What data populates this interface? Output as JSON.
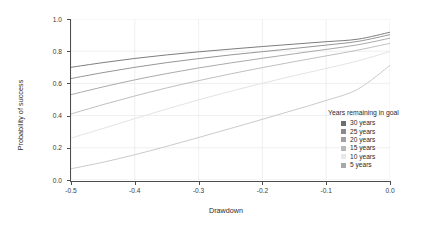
{
  "chart_data": {
    "type": "line",
    "title": "",
    "xlabel": "Drawdown",
    "ylabel": "Probability of success",
    "xlim": [
      -0.5,
      0.0
    ],
    "ylim": [
      0.0,
      1.0
    ],
    "xticks": [
      -0.5,
      -0.4,
      -0.3,
      -0.2,
      -0.1,
      0.0
    ],
    "xtick_labels": [
      "-0.5",
      "-0.4",
      "-0.3",
      "-0.2",
      "-0.1",
      "0.0"
    ],
    "yticks": [
      0.0,
      0.2,
      0.4,
      0.6,
      0.8,
      1.0
    ],
    "ytick_labels": [
      "0.0",
      "0.2",
      "0.4",
      "0.6",
      "0.8",
      "1.0"
    ],
    "grid": true,
    "grid_color": "#ebebeb",
    "panel_background": "#ffffff",
    "legend_position": "right-inside",
    "legend_title": "Years remaining in goal",
    "x": [
      -0.5,
      -0.45,
      -0.4,
      -0.35,
      -0.3,
      -0.25,
      -0.2,
      -0.15,
      -0.1,
      -0.05,
      0.0
    ],
    "series": [
      {
        "name": "30 years",
        "color": "#6e6e6e",
        "values": [
          0.7,
          0.729,
          0.755,
          0.777,
          0.796,
          0.813,
          0.829,
          0.844,
          0.859,
          0.875,
          0.918
        ]
      },
      {
        "name": "25 years",
        "color": "#8a8a8a",
        "values": [
          0.63,
          0.667,
          0.7,
          0.729,
          0.754,
          0.777,
          0.797,
          0.817,
          0.838,
          0.861,
          0.903
        ]
      },
      {
        "name": "20 years",
        "color": "#a0a0a0",
        "values": [
          0.53,
          0.578,
          0.622,
          0.661,
          0.696,
          0.727,
          0.756,
          0.784,
          0.811,
          0.84,
          0.881
        ]
      },
      {
        "name": "15 years",
        "color": "#b8b8b8",
        "values": [
          0.41,
          0.468,
          0.522,
          0.572,
          0.617,
          0.659,
          0.698,
          0.735,
          0.771,
          0.807,
          0.849
        ]
      },
      {
        "name": "10 years",
        "color": "#e0e0e0",
        "values": [
          0.26,
          0.32,
          0.381,
          0.441,
          0.498,
          0.551,
          0.601,
          0.648,
          0.693,
          0.74,
          0.798
        ]
      },
      {
        "name": "5 years",
        "color": "#c4c4c4",
        "values": [
          0.07,
          0.11,
          0.157,
          0.209,
          0.264,
          0.32,
          0.377,
          0.435,
          0.494,
          0.565,
          0.712
        ]
      }
    ]
  },
  "legend": {
    "title": "Years remaining in goal",
    "items": [
      {
        "label": "30 years",
        "color": "#6e6e6e"
      },
      {
        "label": "25 years",
        "color": "#8a8a8a"
      },
      {
        "label": "20 years",
        "color": "#a0a0a0"
      },
      {
        "label": "15 years",
        "color": "#b8b8b8"
      },
      {
        "label": "10 years",
        "color": "#e8e8e8"
      },
      {
        "label": "5 years",
        "color": "#a8a8a8"
      }
    ]
  }
}
